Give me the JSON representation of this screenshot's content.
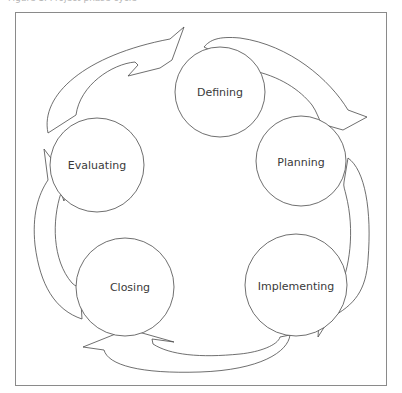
{
  "diagram": {
    "caption": "Figure 1. Project phase cycle",
    "type": "cycle",
    "stages": [
      {
        "id": "defining",
        "label": "Defining",
        "cx": 220,
        "cy": 92,
        "r": 45
      },
      {
        "id": "planning",
        "label": "Planning",
        "cx": 301,
        "cy": 161,
        "r": 45
      },
      {
        "id": "implementing",
        "label": "Implementing",
        "cx": 296,
        "cy": 285,
        "r": 51
      },
      {
        "id": "closing",
        "label": "Closing",
        "cx": 125,
        "cy": 287,
        "r": 49
      },
      {
        "id": "evaluating",
        "label": "Evaluating",
        "cx": 97,
        "cy": 165,
        "r": 47
      }
    ],
    "flow": [
      "Defining",
      "Planning",
      "Implementing",
      "Closing",
      "Evaluating",
      "Defining"
    ],
    "colors": {
      "stroke": "#4a4a4a",
      "frame": "#8a8a8a",
      "text": "#3a3a3a",
      "fill": "#ffffff"
    }
  }
}
